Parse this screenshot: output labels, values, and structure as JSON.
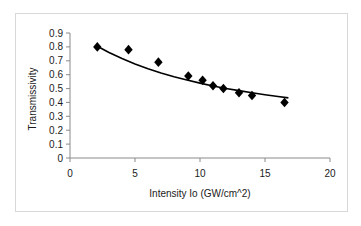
{
  "chart_data": {
    "type": "scatter",
    "title": "",
    "xlabel": "Intensity Io (GW/cm^2)",
    "ylabel": "Transmissivity",
    "xlim": [
      0,
      20
    ],
    "ylim": [
      0,
      0.9
    ],
    "xticks": [
      0,
      5,
      10,
      15,
      20
    ],
    "xtick_labels": [
      "0",
      "5",
      "10",
      "15",
      "20"
    ],
    "yticks": [
      0,
      0.1,
      0.2,
      0.3,
      0.4,
      0.5,
      0.6,
      0.7,
      0.8,
      0.9
    ],
    "ytick_labels": [
      "0",
      "0.1",
      "0.2",
      "0.3",
      "0.4",
      "0.5",
      "0.6",
      "0.7",
      "0.8",
      "0.9"
    ],
    "grid": false,
    "legend": null,
    "legend_position": "none",
    "marker": "diamond",
    "marker_color": "#000000",
    "curve_color": "#000000",
    "series": [
      {
        "name": "Measured transmissivity",
        "marker": "diamond",
        "x": [
          2.1,
          4.5,
          6.8,
          9.1,
          10.2,
          11.0,
          11.8,
          13.0,
          14.0,
          16.5
        ],
        "y": [
          0.8,
          0.78,
          0.69,
          0.59,
          0.56,
          0.52,
          0.5,
          0.47,
          0.45,
          0.4
        ]
      },
      {
        "name": "Fitted curve",
        "marker": "none",
        "x": [
          2.1,
          3.0,
          4.0,
          5.0,
          6.0,
          7.0,
          8.0,
          9.0,
          10.0,
          11.0,
          12.0,
          13.0,
          14.0,
          15.0,
          16.0,
          16.8
        ],
        "y": [
          0.805,
          0.76,
          0.716,
          0.677,
          0.643,
          0.612,
          0.585,
          0.561,
          0.539,
          0.519,
          0.501,
          0.485,
          0.47,
          0.456,
          0.443,
          0.433
        ]
      }
    ]
  },
  "axes": {
    "y_axis_title": "Transmissivity",
    "x_axis_title": "Intensity Io (GW/cm^2)"
  }
}
